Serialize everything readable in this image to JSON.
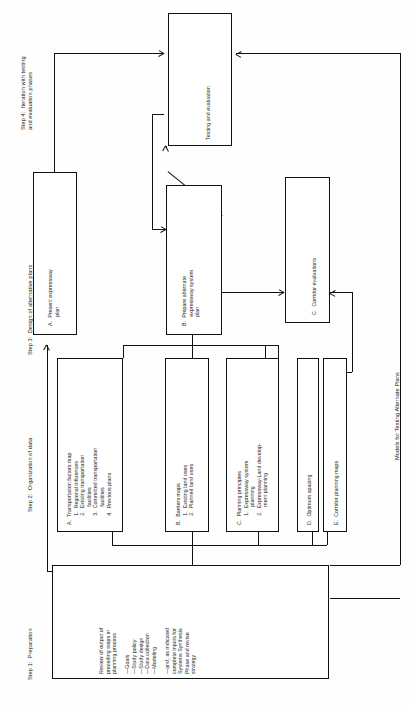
{
  "figure": {
    "caption": "Models for Testing Alternate Plans",
    "orientation": "rotated-90-counterclockwise"
  },
  "steps": {
    "step1": "Step 1:  Preparation",
    "step2": "Step 2:  Organization of data",
    "step3": "Step 3:  Design of alternative plans",
    "step4": "Step 4:  Iteration with testing\nand evaluation phases"
  },
  "boxes": {
    "testing": "Testing and evaluation",
    "step3_a": "A.  Present expressway\n      plan",
    "step3_b": "B.  Prepare alternate\n      expressway system\n      plan",
    "step3_c": "C.  Corridor evaluations",
    "step2_a": "A.  Transportation factors map\n      1.  Regional influences\n      2.  Existing transportation\n            facilities\n      3.  Committed transportation\n            facilities\n      4.  Previous plans",
    "step2_b": "B.  Barriers maps\n      1.  Existing land uses\n      2.  Planned land uses",
    "step2_c": "C.  Planning principles\n      1.  Expressway system\n            planning\n      2.  Expressway-Land develop-\n            ment planning",
    "step2_d": "D.  Optimum spacing",
    "step2_e": "E.  Corridor planning maps",
    "step1_box": "Review of output of\npreceding steps in\nplanning process\n\n—Goals\n—Study policy\n—Study design\n—Data collection\n—Modeling\n\n—and, as indicated\ncomplete inputs for\nSystems Synthesis\nPhase and revise\nstrategy"
  }
}
